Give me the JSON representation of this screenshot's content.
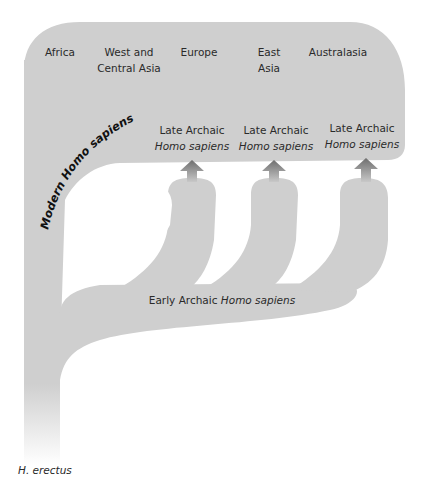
{
  "diagram": {
    "type": "multiregional-evolution-model",
    "regions": [
      {
        "line1": "Africa",
        "line2": ""
      },
      {
        "line1": "West and",
        "line2": "Central Asia"
      },
      {
        "line1": "Europe",
        "line2": ""
      },
      {
        "line1": "East",
        "line2": "Asia"
      },
      {
        "line1": "Australasia",
        "line2": ""
      }
    ],
    "curved_label": "Modern Homo sapiens",
    "late_archaic": [
      {
        "line1": "Late Archaic",
        "line2": "Homo sapiens"
      },
      {
        "line1": "Late Archaic",
        "line2": "Homo sapiens"
      },
      {
        "line1": "Late Archaic",
        "line2": "Homo sapiens"
      }
    ],
    "early_archaic": {
      "plain": "Early Archaic ",
      "italic": "Homo sapiens"
    },
    "root_label": "H. erectus",
    "colors": {
      "fill": "#cfcfcf",
      "arrow_top": "#7a7a7a",
      "arrow_bottom": "#c4c4c4",
      "text": "#2a2a2a"
    }
  }
}
